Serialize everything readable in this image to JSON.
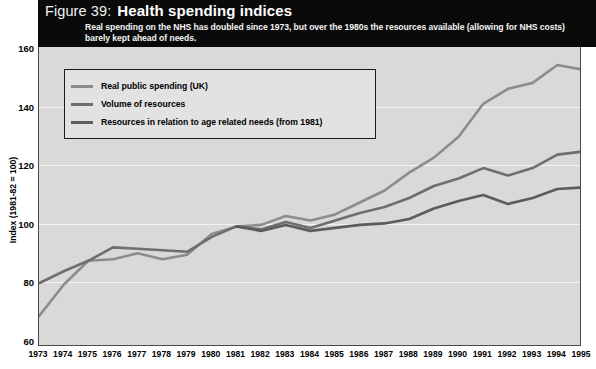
{
  "header": {
    "figure_number": "Figure 39:",
    "title": "Health spending indices",
    "subtitle": "Real spending on the NHS has doubled since 1973, but over the 1980s the resources available (allowing for NHS costs) barely kept ahead of needs."
  },
  "legend": {
    "position": "inside-top-left",
    "items": [
      {
        "label": "Real public spending (UK)",
        "color": "#8c8c8c"
      },
      {
        "label": "Volume of resources",
        "color": "#6e6e6e"
      },
      {
        "label": "Resources in relation to age related needs (from 1981)",
        "color": "#5c5c5c"
      }
    ]
  },
  "axes": {
    "y_title": "Index (1981-82 = 100)",
    "y_ticks": [
      60,
      80,
      100,
      120,
      140,
      160
    ],
    "x_ticks": [
      1973,
      1974,
      1975,
      1976,
      1977,
      1978,
      1979,
      1980,
      1981,
      1982,
      1983,
      1984,
      1985,
      1986,
      1987,
      1988,
      1989,
      1990,
      1991,
      1992,
      1993,
      1994,
      1995
    ]
  },
  "colors": {
    "header_band": "#0a0a0a",
    "plot_background": "#d9d9d9",
    "gridline": "#f3f3f3",
    "frame": "#4a4a4a"
  },
  "chart_data": {
    "type": "line",
    "title": "Health spending indices",
    "subtitle": "Real spending on the NHS has doubled since 1973, but over the 1980s the resources available (allowing for NHS costs) barely kept ahead of needs.",
    "xlabel": "",
    "ylabel": "Index (1981-82 = 100)",
    "xlim": [
      1973,
      1995
    ],
    "ylim": [
      60,
      160
    ],
    "grid": true,
    "legend_position": "upper left",
    "x": [
      1973,
      1974,
      1975,
      1976,
      1977,
      1978,
      1979,
      1980,
      1981,
      1982,
      1983,
      1984,
      1985,
      1986,
      1987,
      1988,
      1989,
      1990,
      1991,
      1992,
      1993,
      1994,
      1995
    ],
    "series": [
      {
        "name": "Real public spending (UK)",
        "color": "#8c8c8c",
        "values": [
          70,
          80.5,
          88.5,
          89,
          91,
          89,
          90.5,
          97.5,
          100,
          100.5,
          103.5,
          102,
          104,
          108,
          112,
          118,
          123,
          130,
          141,
          146,
          148,
          154,
          152.5
        ]
      },
      {
        "name": "Volume of resources",
        "color": "#6e6e6e",
        "values": [
          81,
          85,
          88.5,
          93,
          92.5,
          92,
          91.5,
          96.5,
          100,
          99,
          101.5,
          99.5,
          102,
          104.5,
          106.5,
          109.5,
          113.5,
          116,
          119.5,
          117,
          119.5,
          124,
          125
        ]
      },
      {
        "name": "Resources in relation to age related needs (from 1981)",
        "color": "#5c5c5c",
        "values": [
          null,
          null,
          null,
          null,
          null,
          null,
          null,
          null,
          100,
          98.5,
          100.5,
          98.5,
          99.5,
          100.5,
          101,
          102.5,
          106,
          108.5,
          110.5,
          107.5,
          109.5,
          112.5,
          113
        ]
      }
    ]
  }
}
